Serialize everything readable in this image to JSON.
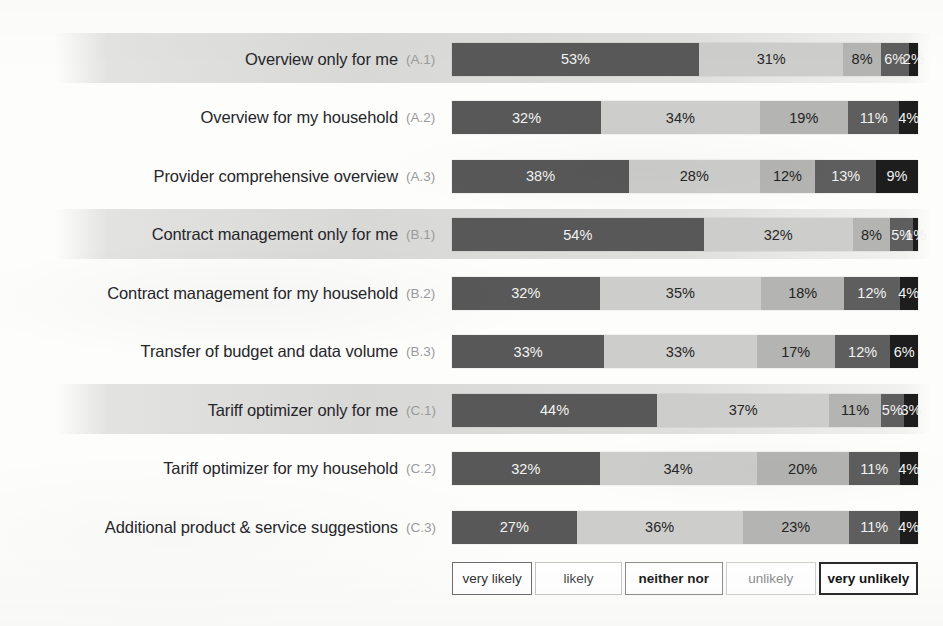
{
  "chart_data": {
    "type": "bar",
    "subtype": "stacked-horizontal-100",
    "title": "",
    "xlabel": "",
    "ylabel": "",
    "xlim": [
      0,
      100
    ],
    "grid": false,
    "legend_position": "bottom",
    "value_suffix": "%",
    "categories": [
      "Overview only for me",
      "Overview for my household",
      "Provider comprehensive overview",
      "Contract management only for me",
      "Contract management for my household",
      "Transfer of budget and data volume",
      "Tariff optimizer only for me",
      "Tariff optimizer for my household",
      "Additional product & service suggestions"
    ],
    "category_codes": [
      "(A.1)",
      "(A.2)",
      "(A.3)",
      "(B.1)",
      "(B.2)",
      "(B.3)",
      "(C.1)",
      "(C.2)",
      "(C.3)"
    ],
    "legend": [
      "very likely",
      "likely",
      "neither nor",
      "unlikely",
      "very unlikely"
    ],
    "colors": [
      "#585858",
      "#cdcdcb",
      "#b4b4b2",
      "#5e5e5e",
      "#1d1d1d"
    ],
    "series": [
      {
        "name": "very likely",
        "values": [
          53,
          32,
          38,
          54,
          32,
          33,
          44,
          32,
          27
        ]
      },
      {
        "name": "likely",
        "values": [
          31,
          34,
          28,
          32,
          35,
          33,
          37,
          34,
          36
        ]
      },
      {
        "name": "neither nor",
        "values": [
          8,
          19,
          12,
          8,
          18,
          17,
          11,
          20,
          23
        ]
      },
      {
        "name": "unlikely",
        "values": [
          6,
          11,
          13,
          5,
          12,
          12,
          5,
          11,
          11
        ]
      },
      {
        "name": "very unlikely",
        "values": [
          2,
          4,
          9,
          1,
          4,
          6,
          3,
          4,
          4
        ]
      }
    ],
    "highlighted_rows": [
      0,
      3,
      6
    ]
  },
  "rows": [
    {
      "label": "Overview only for me",
      "code": "(A.1)",
      "values": [
        53,
        31,
        8,
        6,
        2
      ],
      "labels": [
        "53%",
        "31%",
        "8%",
        "6%",
        "2%"
      ],
      "band": true
    },
    {
      "label": "Overview for my household",
      "code": "(A.2)",
      "values": [
        32,
        34,
        19,
        11,
        4
      ],
      "labels": [
        "32%",
        "34%",
        "19%",
        "11%",
        "4%"
      ],
      "band": false
    },
    {
      "label": "Provider comprehensive overview",
      "code": "(A.3)",
      "values": [
        38,
        28,
        12,
        13,
        9
      ],
      "labels": [
        "38%",
        "28%",
        "12%",
        "13%",
        "9%"
      ],
      "band": false
    },
    {
      "label": "Contract management only for me",
      "code": "(B.1)",
      "values": [
        54,
        32,
        8,
        5,
        1
      ],
      "labels": [
        "54%",
        "32%",
        "8%",
        "5%",
        "1%"
      ],
      "band": true
    },
    {
      "label": "Contract management for my household",
      "code": "(B.2)",
      "values": [
        32,
        35,
        18,
        12,
        4
      ],
      "labels": [
        "32%",
        "35%",
        "18%",
        "12%",
        "4%"
      ],
      "band": false
    },
    {
      "label": "Transfer of budget and data volume",
      "code": "(B.3)",
      "values": [
        33,
        33,
        17,
        12,
        6
      ],
      "labels": [
        "33%",
        "33%",
        "17%",
        "12%",
        "6%"
      ],
      "band": false
    },
    {
      "label": "Tariff optimizer only for me",
      "code": "(C.1)",
      "values": [
        44,
        37,
        11,
        5,
        3
      ],
      "labels": [
        "44%",
        "37%",
        "11%",
        "5%",
        "3%"
      ],
      "band": true
    },
    {
      "label": "Tariff optimizer for my household",
      "code": "(C.2)",
      "values": [
        32,
        34,
        20,
        11,
        4
      ],
      "labels": [
        "32%",
        "34%",
        "20%",
        "11%",
        "4%"
      ],
      "band": false
    },
    {
      "label": "Additional product & service suggestions",
      "code": "(C.3)",
      "values": [
        27,
        36,
        23,
        11,
        4
      ],
      "labels": [
        "27%",
        "36%",
        "23%",
        "11%",
        "4%"
      ],
      "band": false
    }
  ],
  "legend": [
    {
      "label": "very likely"
    },
    {
      "label": "likely"
    },
    {
      "label": "neither nor"
    },
    {
      "label": "unlikely"
    },
    {
      "label": "very unlikely"
    }
  ]
}
